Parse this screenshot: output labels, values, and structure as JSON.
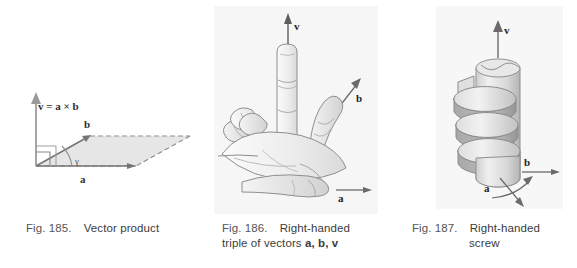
{
  "page": {
    "background_color": "#ffffff",
    "width": 577,
    "height": 268
  },
  "figures": [
    {
      "id": "fig-185",
      "number": "Fig. 185.",
      "title": "Vector product",
      "panel_background": "#ffffff",
      "labels": {
        "result": "v = a × b",
        "vector_a": "a",
        "vector_b": "b",
        "angle": "γ"
      }
    },
    {
      "id": "fig-186",
      "number": "Fig. 186.",
      "title": "Right-handed",
      "title_line2_prefix": "triple of vectors ",
      "title_line2_vectors": "a, b, v",
      "panel_background": "#f6f6f6",
      "labels": {
        "vector_v": "v",
        "vector_b": "b",
        "vector_a": "a"
      }
    },
    {
      "id": "fig-187",
      "number": "Fig. 187.",
      "title": "Right-handed",
      "title_line2": "screw",
      "panel_background": "#f7f7f7",
      "labels": {
        "vector_v": "v",
        "vector_b": "b",
        "vector_a": "a"
      }
    }
  ],
  "colors": {
    "caption_text": "#3b3b3b",
    "line_ink": "#6f6f6f",
    "fill_light": "#e3e3e3",
    "fill_mid": "#cccccc",
    "fill_dark": "#b0b0b0"
  }
}
